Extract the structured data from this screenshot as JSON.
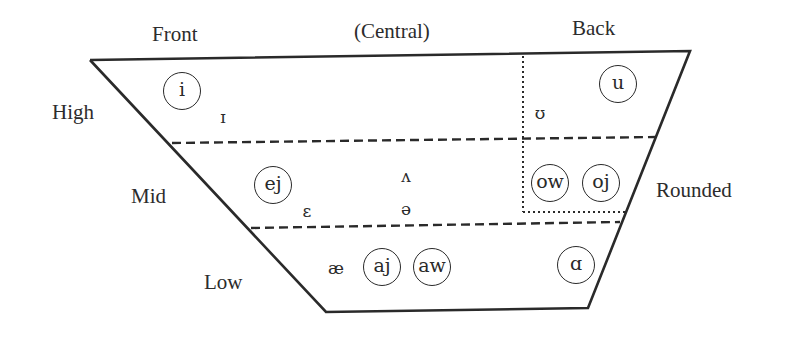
{
  "diagram": {
    "columns": {
      "front": "Front",
      "central": "(Central)",
      "back": "Back"
    },
    "rows": {
      "high": "High",
      "mid": "Mid",
      "low": "Low"
    },
    "side_label": "Rounded",
    "vowels": {
      "i": {
        "symbol": "i",
        "circled": true
      },
      "small_cap_i": {
        "symbol": "ɪ",
        "circled": false
      },
      "upsilon": {
        "symbol": "ʊ",
        "circled": false
      },
      "u": {
        "symbol": "u",
        "circled": true
      },
      "ej": {
        "symbol": "ej",
        "circled": true
      },
      "epsilon": {
        "symbol": "ɛ",
        "circled": false
      },
      "wedge": {
        "symbol": "ʌ",
        "circled": false
      },
      "schwa": {
        "symbol": "ə",
        "circled": false
      },
      "ow": {
        "symbol": "ow",
        "circled": true
      },
      "oj": {
        "symbol": "oj",
        "circled": true
      },
      "ash": {
        "symbol": "æ",
        "circled": false
      },
      "aj": {
        "symbol": "aj",
        "circled": true
      },
      "aw": {
        "symbol": "aw",
        "circled": true
      },
      "script_a": {
        "symbol": "ɑ",
        "circled": true
      }
    },
    "colors": {
      "ink": "#2a2a2a",
      "background": "#ffffff"
    }
  }
}
